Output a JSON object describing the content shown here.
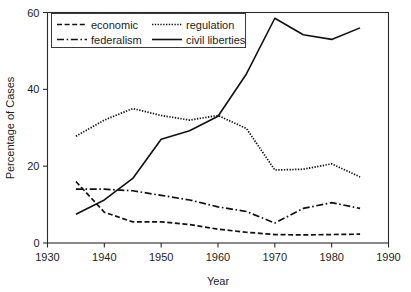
{
  "chart_data": {
    "type": "line",
    "title": "",
    "xlabel": "Year",
    "ylabel": "Percentage of Cases",
    "xlim": [
      1930,
      1990
    ],
    "ylim": [
      0,
      60
    ],
    "xticks": [
      1930,
      1940,
      1950,
      1960,
      1970,
      1980,
      1990
    ],
    "yticks": [
      0,
      20,
      40,
      60
    ],
    "grid": false,
    "legend_position": "upper-left",
    "x": [
      1935,
      1940,
      1945,
      1950,
      1955,
      1960,
      1965,
      1970,
      1975,
      1980,
      1985
    ],
    "series": [
      {
        "name": "economic",
        "style": "dashed",
        "values": [
          16.0,
          8.0,
          5.5,
          5.5,
          4.8,
          3.6,
          2.8,
          2.2,
          2.1,
          2.2,
          2.3
        ]
      },
      {
        "name": "regulation",
        "style": "dotted",
        "values": [
          27.8,
          32.0,
          35.0,
          33.2,
          32.0,
          33.2,
          29.8,
          19.0,
          19.2,
          20.6,
          17.2
        ]
      },
      {
        "name": "federalism",
        "style": "dash-dot",
        "values": [
          14.0,
          14.0,
          13.6,
          12.4,
          11.2,
          9.4,
          8.2,
          5.2,
          9.0,
          10.5,
          9.0
        ]
      },
      {
        "name": "civil liberties",
        "style": "solid",
        "values": [
          7.5,
          11.2,
          16.8,
          27.0,
          29.2,
          33.0,
          44.0,
          58.5,
          54.2,
          53.0,
          56.0
        ]
      }
    ]
  },
  "legend": {
    "entries": [
      {
        "label": "economic",
        "style": "dashed"
      },
      {
        "label": "regulation",
        "style": "dotted"
      },
      {
        "label": "federalism",
        "style": "dash-dot"
      },
      {
        "label": "civil liberties",
        "style": "solid"
      }
    ]
  },
  "colors": {
    "line": "#111111",
    "axis": "#2b2b2b",
    "background": "#ffffff",
    "text": "#1d1d1d"
  }
}
